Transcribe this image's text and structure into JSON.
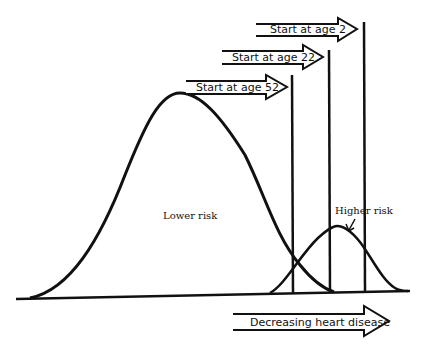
{
  "diagram": {
    "type": "risk-distribution",
    "curves": [
      {
        "id": "lower",
        "label": "Lower risk"
      },
      {
        "id": "higher",
        "label": "Higher risk"
      }
    ],
    "start_arrows": [
      {
        "label": "Start at age 2"
      },
      {
        "label": "Start at age 22"
      },
      {
        "label": "Start at age 52"
      }
    ],
    "bottom_arrow": {
      "label": "Decreasing heart disease"
    },
    "colors": {
      "line": "#111111",
      "background": "#ffffff"
    }
  }
}
